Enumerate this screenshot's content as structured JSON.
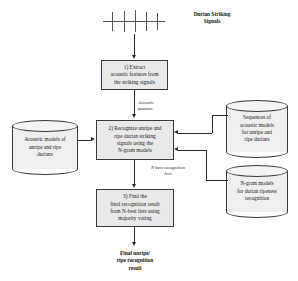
{
  "diagram": {
    "signal_label": "Durian Striking\nSignals",
    "signal_label_line1": "Durian Striking",
    "signal_label_line2": "Signals",
    "steps": [
      {
        "id": "step-1",
        "text": "1) Extract\nacoustic features from\nthe striking signals",
        "lines": [
          "1) Extract",
          "acoustic features from",
          "the striking signals"
        ]
      },
      {
        "id": "step-2",
        "text": "2) Recognize unripe and\nripe durian striking\nsignals using the\nN-gram models",
        "lines": [
          "2) Recognize unripe and",
          "ripe durian striking",
          "signals using the",
          "N-gram models"
        ]
      },
      {
        "id": "step-3",
        "text": "3) Find the\nfinal recognition result\nfrom N-best lists using\nmajority voting",
        "lines": [
          "3) Find the",
          "final recognition result",
          "from N-best lists using",
          "majority voting"
        ]
      }
    ],
    "datastores": [
      {
        "id": "acoustic-models-store",
        "text": "Acoustic models of\nunripe and ripe\ndurians"
      },
      {
        "id": "model-sequences-store",
        "text": "Sequences of\nacoustic models\nfor unripe and\nripe durians"
      },
      {
        "id": "ngram-models-store",
        "text": "N-gram models\nfor durian ripeness\nrecognition"
      }
    ],
    "edge_labels": [
      {
        "id": "acoustic-features-label",
        "text": "Acoustic\nfeatures"
      },
      {
        "id": "nbest-lists-label",
        "text": "N-best recognition\nlists"
      }
    ],
    "output_label": "Final unripe/\nripe recognition\nresult",
    "colors": {
      "box_fill": "#e9e9e9",
      "cylinder_fill": "#efefef",
      "stroke": "#3a3a3a",
      "arrow": "#2b2b2b",
      "text": "#1a1a1a",
      "background": "#ffffff"
    },
    "waveform": {
      "spike_count": 5,
      "description": "impulse striking signal waveform"
    }
  }
}
